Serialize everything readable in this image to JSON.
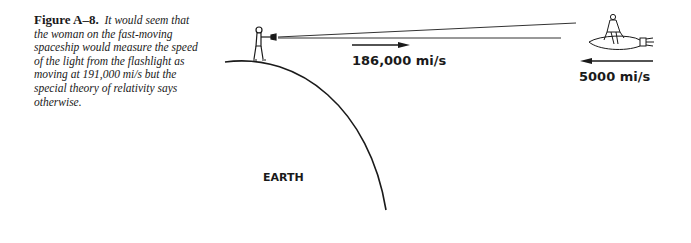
{
  "figure": {
    "label": "Figure A–8.",
    "caption": "It would seem that the woman on the fast-moving spaceship would measure the speed of the light from the flashlight as moving at 191,000 mi/s but the special theory of relativity says otherwise."
  },
  "diagram": {
    "earth_label": "EARTH",
    "light_speed_label": "186,000 mi/s",
    "ship_speed_label": "5000 mi/s",
    "elements": {
      "person": "man-with-flashlight",
      "ship": "spaceship-with-woman",
      "light_beam": "flashlight-beam",
      "light_arrow_direction": "right",
      "ship_arrow_direction": "left"
    }
  }
}
